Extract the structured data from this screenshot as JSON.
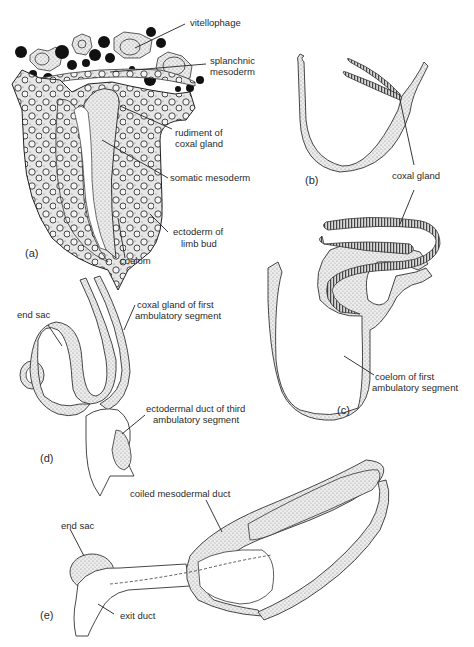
{
  "figure": {
    "panels": [
      {
        "id": "a",
        "label": "(a)"
      },
      {
        "id": "b",
        "label": "(b)"
      },
      {
        "id": "c",
        "label": "(c)"
      },
      {
        "id": "d",
        "label": "(d)"
      },
      {
        "id": "e",
        "label": "(e)"
      }
    ],
    "labels": {
      "a": {
        "vitellophage": "vitellophage",
        "splanchnic_1": "splanchnic",
        "splanchnic_2": "mesoderm",
        "rudiment_1": "rudiment of",
        "rudiment_2": "coxal gland",
        "somatic": "somatic mesoderm",
        "ectoderm_1": "ectoderm of",
        "ectoderm_2": "limb bud",
        "coelom": "coelom"
      },
      "b": {
        "coxal_gland": "coxal gland"
      },
      "c": {
        "coelom_1": "coelom of first",
        "coelom_2": "ambulatory segment"
      },
      "d": {
        "end_sac": "end sac",
        "coxal_1": "coxal gland of first",
        "coxal_2": "ambulatory segment",
        "ecto_1": "ectodermal duct of third",
        "ecto_2": "ambulatory segment"
      },
      "e": {
        "coiled": "coiled mesodermal duct",
        "end_sac": "end sac",
        "exit_duct": "exit duct"
      }
    },
    "colors": {
      "ink": "#222222",
      "stipple": "#c9c9c9",
      "background": "#ffffff"
    }
  }
}
